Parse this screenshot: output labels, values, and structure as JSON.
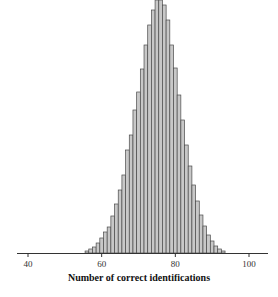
{
  "chart_data": {
    "type": "bar",
    "title": "",
    "xlabel": "Number of correct identifications",
    "ylabel": "",
    "xlim": [
      36,
      106
    ],
    "x_ticks": [
      40,
      60,
      80,
      100
    ],
    "grid": false,
    "legend": null,
    "bar_color": "#c8c8c8",
    "edge_color": "#4a4a4a",
    "note": "Histogram of counts; y-axis unlabeled, peak clipped at top. Values are relative bar heights in pixels.",
    "categories": [
      56,
      57,
      58,
      59,
      60,
      61,
      62,
      63,
      64,
      65,
      66,
      67,
      68,
      69,
      70,
      71,
      72,
      73,
      74,
      75,
      76,
      77,
      78,
      79,
      80,
      81,
      82,
      83,
      84,
      85,
      86,
      87,
      88,
      89,
      90,
      91,
      92,
      93
    ],
    "values": [
      2,
      4,
      6,
      10,
      15,
      21,
      26,
      37,
      49,
      63,
      78,
      103,
      118,
      143,
      161,
      184,
      208,
      228,
      243,
      253,
      253,
      248,
      233,
      208,
      185,
      158,
      133,
      108,
      87,
      68,
      52,
      38,
      27,
      18,
      12,
      7,
      4,
      2
    ]
  }
}
